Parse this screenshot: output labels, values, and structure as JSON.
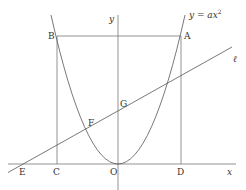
{
  "diagram": {
    "type": "coordinate-geometry",
    "curve_label": "y = ax²",
    "curve_label_parts": {
      "lhs": "y",
      "eq": " = ",
      "a": "a",
      "x": "x",
      "exp": "2"
    },
    "axes": {
      "x_label": "x",
      "y_label": "y",
      "origin_label": "O"
    },
    "line_label": "ℓ",
    "points": {
      "A": "A",
      "B": "B",
      "C": "C",
      "D": "D",
      "E": "E",
      "F": "F",
      "G": "G",
      "O": "O"
    },
    "colors": {
      "line": "#555555",
      "text": "#333333",
      "background": "#ffffff"
    }
  }
}
